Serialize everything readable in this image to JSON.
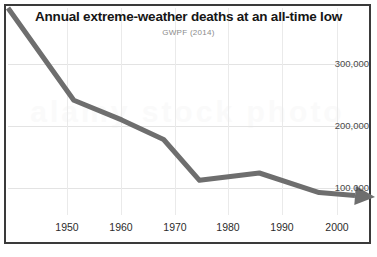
{
  "chart_data": {
    "type": "line",
    "title": "Annual extreme-weather deaths at an all-time low",
    "subtitle": "GWPF (2014)",
    "source_label": "GWPF (2014)",
    "xlabel": "",
    "ylabel": "",
    "xlim": [
      1944,
      2004
    ],
    "ylim": [
      0,
      370000
    ],
    "xticks": [
      1950,
      1960,
      1970,
      1980,
      1990,
      2000
    ],
    "xtick_labels": [
      "1950",
      "1960",
      "1970",
      "1980",
      "1990",
      "2000"
    ],
    "yticks": [
      100000,
      200000,
      300000
    ],
    "ytick_labels": [
      "100,000",
      "200,000",
      "300,000"
    ],
    "y_axis_position": "right",
    "grid": true,
    "legend": false,
    "series": [
      {
        "name": "Annual extreme-weather deaths",
        "x": [
          1944,
          1955,
          1963,
          1970,
          1976,
          1986,
          1996,
          2002
        ],
        "values": [
          370000,
          205000,
          170000,
          135000,
          62000,
          75000,
          40000,
          35000
        ],
        "color": "#6e6e6e",
        "line_width": 5,
        "arrow_end": true
      }
    ],
    "annotations": [
      {
        "type": "arrowhead",
        "at_x": 2003,
        "direction": "right",
        "note": "trend arrow at end of series"
      }
    ],
    "watermark_text": "alamy stock photo",
    "colors": {
      "line": "#6e6e6e",
      "border": "#3a3a3a",
      "gridline": "#e3e3e3",
      "title": "#161616",
      "subtitle": "#8b8b8b",
      "background": "#ffffff"
    }
  }
}
